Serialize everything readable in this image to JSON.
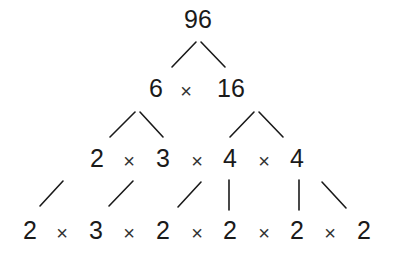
{
  "diagram": {
    "type": "factor-tree",
    "root": "96",
    "rows": [
      {
        "level": 0,
        "tokens": [
          "96"
        ]
      },
      {
        "level": 1,
        "tokens": [
          "6",
          "×",
          "16"
        ]
      },
      {
        "level": 2,
        "tokens": [
          "2",
          "×",
          "3",
          "×",
          "4",
          "×",
          "4"
        ]
      },
      {
        "level": 3,
        "tokens": [
          "2",
          "×",
          "3",
          "×",
          "2",
          "×",
          "2",
          "×",
          "2",
          "×",
          "2"
        ]
      }
    ],
    "edges": [
      {
        "from": "96",
        "to": "6"
      },
      {
        "from": "96",
        "to": "16"
      },
      {
        "from": "6",
        "to": "2"
      },
      {
        "from": "6",
        "to": "3"
      },
      {
        "from": "16",
        "to": "4 (left)"
      },
      {
        "from": "16",
        "to": "4 (right)"
      },
      {
        "from": "2",
        "to": "2"
      },
      {
        "from": "3",
        "to": "3"
      },
      {
        "from": "4 (left)",
        "to": "2"
      },
      {
        "from": "4 (left)",
        "to": "2"
      },
      {
        "from": "4 (right)",
        "to": "2"
      },
      {
        "from": "4 (right)",
        "to": "2"
      }
    ]
  }
}
